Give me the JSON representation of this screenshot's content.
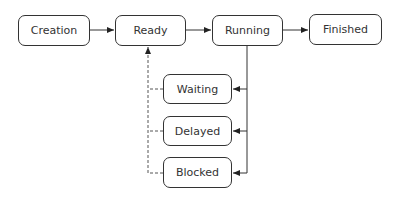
{
  "diagram": {
    "nodes": {
      "creation": {
        "label": "Creation",
        "x": 18,
        "y": 15,
        "w": 72,
        "h": 31
      },
      "ready": {
        "label": "Ready",
        "x": 115,
        "y": 15,
        "w": 71,
        "h": 31
      },
      "running": {
        "label": "Running",
        "x": 212,
        "y": 15,
        "w": 71,
        "h": 31
      },
      "finished": {
        "label": "Finished",
        "x": 309,
        "y": 14,
        "w": 73,
        "h": 31
      },
      "waiting": {
        "label": "Waiting",
        "x": 163,
        "y": 74,
        "w": 69,
        "h": 30
      },
      "delayed": {
        "label": "Delayed",
        "x": 163,
        "y": 116,
        "w": 69,
        "h": 30
      },
      "blocked": {
        "label": "Blocked",
        "x": 163,
        "y": 157,
        "w": 69,
        "h": 31
      }
    },
    "edges": [
      {
        "from": "Creation",
        "to": "Ready",
        "style": "solid"
      },
      {
        "from": "Ready",
        "to": "Running",
        "style": "solid"
      },
      {
        "from": "Running",
        "to": "Finished",
        "style": "solid"
      },
      {
        "from": "Running",
        "to": "Waiting",
        "style": "solid"
      },
      {
        "from": "Running",
        "to": "Delayed",
        "style": "solid"
      },
      {
        "from": "Running",
        "to": "Blocked",
        "style": "solid"
      },
      {
        "from": "Waiting",
        "to": "Ready",
        "style": "dashed"
      },
      {
        "from": "Delayed",
        "to": "Ready",
        "style": "dashed"
      },
      {
        "from": "Blocked",
        "to": "Ready",
        "style": "dashed"
      }
    ],
    "colors": {
      "stroke": "#333333",
      "background": "#ffffff"
    }
  }
}
